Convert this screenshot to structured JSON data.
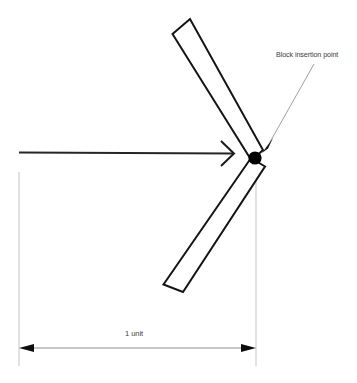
{
  "diagram": {
    "type": "cad-technical-drawing",
    "canvas": {
      "width": 357,
      "height": 383,
      "background": "#ffffff"
    },
    "colors": {
      "outline": "#1a1a1a",
      "marker_fill": "#000000",
      "leader_line": "#9a9a9a",
      "extension_line": "#c9c9c9",
      "dimension_line": "#8a8a8a",
      "text": "#3c3c3c"
    },
    "annotations": {
      "insertion_point_label": "Block insertion point",
      "dimension_label": "1 unit"
    },
    "geometry": {
      "insertion_point": {
        "x": 255,
        "y": 158,
        "radius": 6.5
      },
      "upper_arm": {
        "name": "upper-arm",
        "points": "172,34 190,19 262,151 250,160"
      },
      "lower_arm": {
        "name": "lower-arm",
        "points": "252,160 264,166 183,292 163,285"
      },
      "horizontal_arrow": {
        "name": "horizontal-arrow",
        "from": {
          "x": 19,
          "y": 152
        },
        "to": {
          "x": 234,
          "y": 154
        },
        "barb_upper": "234,154 222,143",
        "barb_lower": "234,154 222,165"
      },
      "leader_line": {
        "name": "leader-line",
        "from": {
          "x": 314,
          "y": 64
        },
        "to": {
          "x": 268,
          "y": 145
        },
        "arrow_tip": {
          "x": 263,
          "y": 152
        }
      },
      "dimension": {
        "left_extension": {
          "x": 19,
          "y1": 172,
          "y2": 366
        },
        "right_extension": {
          "x": 256,
          "y1": 170,
          "y2": 366
        },
        "line_y": 348,
        "left_arrow_tip": {
          "x": 20,
          "y": 348
        },
        "right_arrow_tip": {
          "x": 255,
          "y": 348
        }
      }
    }
  }
}
